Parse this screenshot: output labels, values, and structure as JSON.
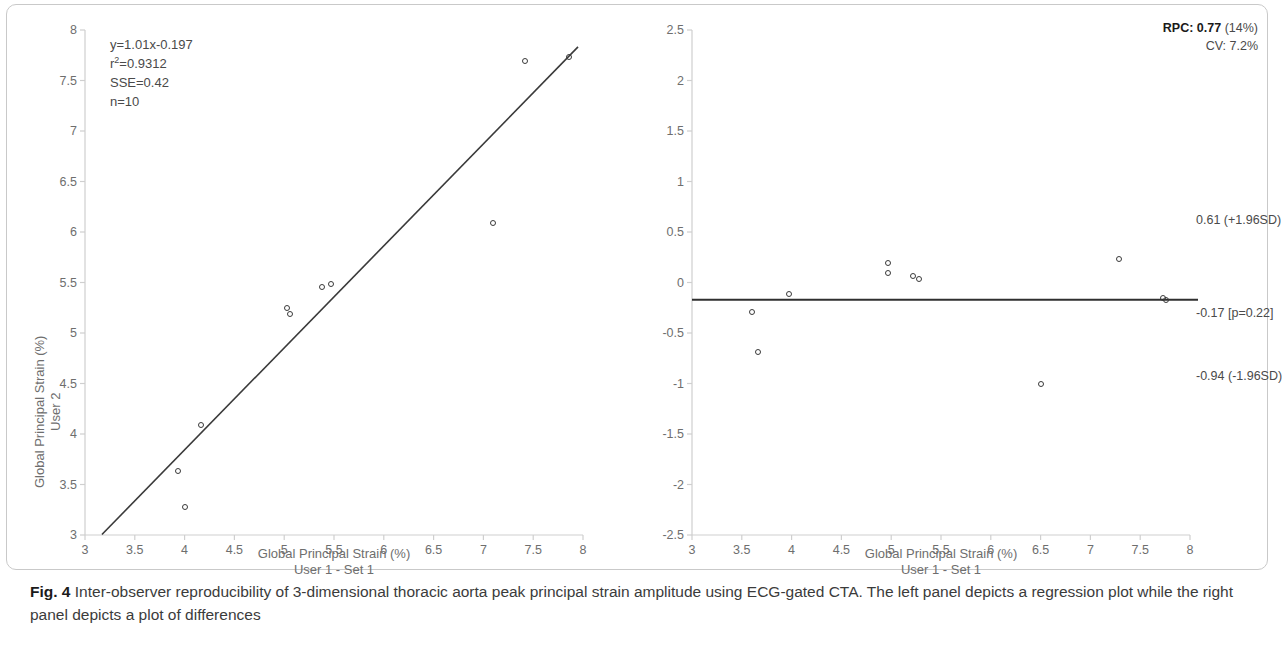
{
  "figure": {
    "caption_number": "Fig. 4",
    "caption_text": " Inter-observer reproducibility of 3-dimensional thoracic aorta peak principal strain amplitude using ECG-gated CTA. The left panel depicts a regression plot while the right panel depicts a plot of differences"
  },
  "chart_data": [
    {
      "type": "scatter",
      "panel": "left",
      "title": "",
      "xlabel": "Global Principal Strain (%)",
      "xlabel_line2": "User 1 - Set 1",
      "ylabel": "Global Principal Strain (%)",
      "ylabel_line2": "User 2",
      "xlim": [
        3,
        8
      ],
      "ylim": [
        3,
        8
      ],
      "xticks": [
        3,
        3.5,
        4,
        4.5,
        5,
        5.5,
        6,
        6.5,
        7,
        7.5,
        8
      ],
      "xticklabels": [
        "3",
        "3.5",
        "4",
        "4.5",
        "5",
        "5.5",
        "6",
        "6.5",
        "7",
        "7.5",
        "8"
      ],
      "yticks": [
        3,
        3.5,
        4,
        4.5,
        5,
        5.5,
        6,
        6.5,
        7,
        7.5,
        8
      ],
      "yticklabels": [
        "3",
        "3.5",
        "4",
        "4.5",
        "5",
        "5.5",
        "6",
        "6.5",
        "7",
        "7.5",
        "8"
      ],
      "grid": false,
      "legend": "none",
      "points": [
        {
          "x": 3.93,
          "y": 3.63
        },
        {
          "x": 4.0,
          "y": 3.28
        },
        {
          "x": 4.16,
          "y": 4.09
        },
        {
          "x": 5.03,
          "y": 5.25
        },
        {
          "x": 5.06,
          "y": 5.19
        },
        {
          "x": 5.38,
          "y": 5.46
        },
        {
          "x": 5.47,
          "y": 5.49
        },
        {
          "x": 7.1,
          "y": 6.09
        },
        {
          "x": 7.42,
          "y": 7.69
        },
        {
          "x": 7.86,
          "y": 7.73
        }
      ],
      "fit_line": {
        "slope": 1.01,
        "intercept": -0.197,
        "x_start": 3.17,
        "x_end": 7.95
      },
      "annotations": {
        "equation": "y=1.01x-0.197",
        "r2_prefix": "r",
        "r2_sup": "2",
        "r2_value": "=0.9312",
        "sse": "SSE=0.42",
        "n": "n=10"
      }
    },
    {
      "type": "scatter",
      "panel": "right",
      "title": "",
      "xlabel": "Global Principal Strain (%)",
      "xlabel_line2": "User 1 - Set 1",
      "ylabel": "",
      "xlim": [
        3,
        8
      ],
      "ylim": [
        -2.5,
        2.5
      ],
      "xticks": [
        3,
        3.5,
        4,
        4.5,
        5,
        5.5,
        6,
        6.5,
        7,
        7.5,
        8
      ],
      "xticklabels": [
        "3",
        "3.5",
        "4",
        "4.5",
        "5",
        "5.5",
        "6",
        "6.5",
        "7",
        "7.5",
        "8"
      ],
      "yticks": [
        -2.5,
        -2,
        -1.5,
        -1,
        -0.5,
        0,
        0.5,
        1,
        1.5,
        2,
        2.5
      ],
      "yticklabels": [
        "-2.5",
        "-2",
        "-1.5",
        "-1",
        "-0.5",
        "0",
        "0.5",
        "1",
        "1.5",
        "2",
        "2.5"
      ],
      "grid": false,
      "legend": "none",
      "points": [
        {
          "x": 3.6,
          "y": -0.29
        },
        {
          "x": 3.66,
          "y": -0.69
        },
        {
          "x": 3.97,
          "y": -0.11
        },
        {
          "x": 4.97,
          "y": 0.19
        },
        {
          "x": 4.97,
          "y": 0.09
        },
        {
          "x": 5.22,
          "y": 0.06
        },
        {
          "x": 5.28,
          "y": 0.03
        },
        {
          "x": 6.5,
          "y": -1.0
        },
        {
          "x": 7.29,
          "y": 0.23
        },
        {
          "x": 7.73,
          "y": -0.15
        },
        {
          "x": 7.76,
          "y": -0.17
        }
      ],
      "bias_line": {
        "value": -0.17
      },
      "annotations": {
        "rpc_label": "RPC:",
        "rpc_value": "0.77",
        "rpc_pct": "(14%)",
        "cv": "CV: 7.2%",
        "upper_loa": "0.61 (+1.96SD)",
        "bias": "-0.17 [p=0.22]",
        "lower_loa": "-0.94 (-1.96SD)"
      }
    }
  ],
  "colors": {
    "axis": "#cfcfcf",
    "ticklabel": "#6e6e6e",
    "marker_edge": "#3a3a3a",
    "fit_line": "#3a3a3a",
    "frame": "#c9c9c9",
    "caption": "#3b3b3b"
  }
}
